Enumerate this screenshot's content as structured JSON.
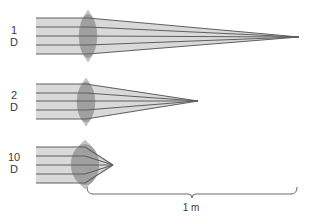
{
  "diagram": {
    "colors": {
      "beam_fill": "#d9d9d9",
      "ray_line": "#5f5f5f",
      "lens_fill": "#9a9a9a",
      "lens_tip": "#c4c4c4",
      "text": "#3a3a3a",
      "bracket": "#6a6a6a"
    },
    "lenses": [
      {
        "power_value": "1",
        "power_unit": "D",
        "beam": {
          "x_start": 36,
          "y_top": 18,
          "y_bottom": 54
        },
        "lens": {
          "cx": 88,
          "top": 10,
          "bottom": 62,
          "half_width": 9
        },
        "focal_point": {
          "x": 299,
          "y": 37
        },
        "rays_y": [
          18,
          27,
          36,
          45,
          54
        ]
      },
      {
        "power_value": "2",
        "power_unit": "D",
        "beam": {
          "x_start": 36,
          "y_top": 84,
          "y_bottom": 119
        },
        "lens": {
          "cx": 86,
          "top": 78,
          "bottom": 126,
          "half_width": 9
        },
        "focal_point": {
          "x": 198,
          "y": 101
        },
        "rays_y": [
          84,
          93,
          101,
          110,
          119
        ]
      },
      {
        "power_value": "10",
        "power_unit": "D",
        "beam": {
          "x_start": 36,
          "y_top": 147,
          "y_bottom": 183
        },
        "lens": {
          "cx": 85,
          "top": 140,
          "bottom": 189,
          "half_width": 14
        },
        "focal_point": {
          "x": 113,
          "y": 165
        },
        "rays_y": [
          147,
          156,
          165,
          174,
          183
        ]
      }
    ],
    "scale_bar": {
      "label": "1 m",
      "x_start": 87,
      "x_end": 297,
      "y": 194
    }
  }
}
